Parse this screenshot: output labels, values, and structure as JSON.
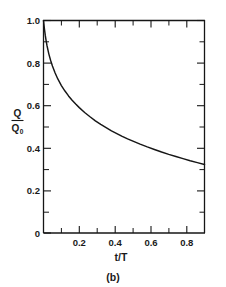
{
  "figure": {
    "caption": "(b)"
  },
  "chart_data": {
    "type": "line",
    "title": "",
    "subtitle": "",
    "xlabel": "t/T",
    "ylabel_numerator": "Q",
    "ylabel_denominator": "Q",
    "ylabel_denominator_subscript": "0",
    "ylabel": "Q/Q0",
    "xlim": [
      0,
      0.9
    ],
    "ylim": [
      0,
      1.0
    ],
    "grid": false,
    "legend": null,
    "legend_position": "none",
    "x_major_ticks": [
      0,
      0.2,
      0.4,
      0.6,
      0.8
    ],
    "x_major_tick_labels": [
      "0",
      "0.2",
      "0.4",
      "0.6",
      "0.8"
    ],
    "x_minor_ticks": [
      0.1,
      0.3,
      0.5,
      0.7
    ],
    "y_major_ticks": [
      0,
      0.2,
      0.4,
      0.6,
      0.8,
      1.0
    ],
    "y_major_tick_labels": [
      "0",
      "0.2",
      "0.4",
      "0.6",
      "0.8",
      "1.0"
    ],
    "y_minor_ticks": [
      0.1,
      0.3,
      0.5,
      0.7,
      0.9
    ],
    "series": [
      {
        "name": "Q/Q0 decay",
        "color": "#161616",
        "x": [
          0.0,
          0.005,
          0.01,
          0.015,
          0.02,
          0.03,
          0.04,
          0.05,
          0.065,
          0.08,
          0.1,
          0.12,
          0.14,
          0.16,
          0.18,
          0.2,
          0.23,
          0.26,
          0.29,
          0.32,
          0.35,
          0.38,
          0.41,
          0.44,
          0.47,
          0.5,
          0.54,
          0.58,
          0.62,
          0.66,
          0.7,
          0.74,
          0.78,
          0.82,
          0.86,
          0.9
        ],
        "y": [
          1.0,
          0.962,
          0.93,
          0.903,
          0.88,
          0.842,
          0.812,
          0.786,
          0.753,
          0.725,
          0.694,
          0.668,
          0.645,
          0.625,
          0.607,
          0.59,
          0.567,
          0.547,
          0.528,
          0.511,
          0.496,
          0.481,
          0.468,
          0.455,
          0.443,
          0.432,
          0.418,
          0.405,
          0.393,
          0.381,
          0.37,
          0.36,
          0.35,
          0.34,
          0.331,
          0.322
        ]
      }
    ]
  }
}
